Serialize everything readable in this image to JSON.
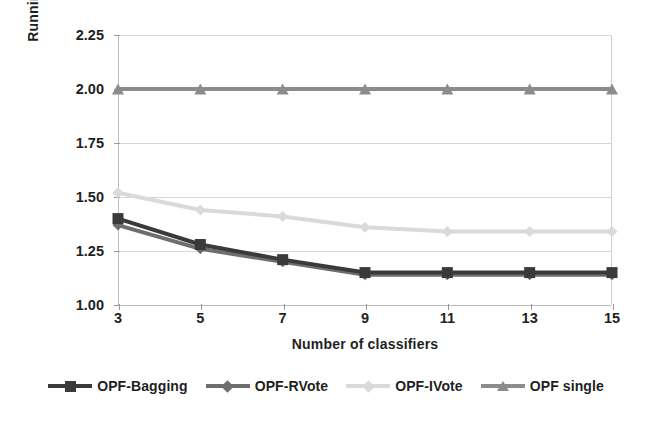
{
  "chart_data": {
    "type": "line",
    "title": "",
    "xlabel": "Number of classifiers",
    "ylabel": "Running time (sec.)",
    "x": [
      3,
      5,
      7,
      9,
      11,
      13,
      15
    ],
    "categories": [
      "3",
      "5",
      "7",
      "9",
      "11",
      "13",
      "15"
    ],
    "xlim": [
      3,
      15
    ],
    "ylim": [
      1.0,
      2.25
    ],
    "yticks": [
      1.0,
      1.25,
      1.5,
      1.75,
      2.0,
      2.25
    ],
    "ytick_labels": [
      "1.00",
      "1.25",
      "1.50",
      "1.75",
      "2.00",
      "2.25"
    ],
    "xtick_labels": [
      "3",
      "5",
      "7",
      "9",
      "11",
      "13",
      "15"
    ],
    "grid": "horizontal",
    "legend_position": "bottom",
    "series": [
      {
        "name": "OPF-Bagging",
        "color": "#3a3a3a",
        "marker": "square",
        "values": [
          1.4,
          1.28,
          1.21,
          1.15,
          1.15,
          1.15,
          1.15
        ]
      },
      {
        "name": "OPF-RVote",
        "color": "#6e6e6e",
        "marker": "diamond",
        "values": [
          1.37,
          1.26,
          1.2,
          1.14,
          1.14,
          1.14,
          1.14
        ]
      },
      {
        "name": "OPF-IVote",
        "color": "#dadada",
        "marker": "diamond",
        "values": [
          1.52,
          1.44,
          1.41,
          1.36,
          1.34,
          1.34,
          1.34
        ]
      },
      {
        "name": "OPF single",
        "color": "#8c8c8c",
        "marker": "triangle",
        "values": [
          2.0,
          2.0,
          2.0,
          2.0,
          2.0,
          2.0,
          2.0
        ]
      }
    ]
  },
  "axes": {
    "y_title": "Running time (sec.)",
    "x_title": "Number of classifiers",
    "y_ticks": [
      "2.25",
      "2.00",
      "1.75",
      "1.50",
      "1.25",
      "1.00"
    ],
    "x_ticks": [
      "3",
      "5",
      "7",
      "9",
      "11",
      "13",
      "15"
    ]
  },
  "legend": {
    "items": [
      {
        "label": "OPF-Bagging",
        "color": "#3a3a3a",
        "marker": "square"
      },
      {
        "label": "OPF-RVote",
        "color": "#6e6e6e",
        "marker": "diamond"
      },
      {
        "label": "OPF-IVote",
        "color": "#dadada",
        "marker": "diamond"
      },
      {
        "label": "OPF single",
        "color": "#8c8c8c",
        "marker": "triangle"
      }
    ]
  },
  "colors": {
    "gridline": "#d7d7d7",
    "axis": "#b8b8b8",
    "text": "#1f1f1f",
    "background": "#ffffff"
  }
}
